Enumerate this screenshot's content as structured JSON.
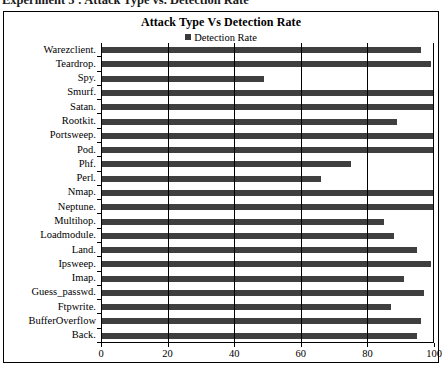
{
  "caption": "Experiment 5 : Attack Type vs. Detection Rate",
  "chart": {
    "title": "Attack Type Vs Detection Rate",
    "legend": {
      "label": "Detection Rate",
      "swatch_color": "#3a3a3a"
    }
  },
  "chart_data": {
    "type": "bar",
    "orientation": "horizontal",
    "title": "Attack Type Vs Detection Rate",
    "xlabel": "",
    "ylabel": "",
    "xlim": [
      0,
      100
    ],
    "xticks": [
      0,
      20,
      40,
      60,
      80,
      100
    ],
    "grid": true,
    "legend_position": "top-center",
    "series": [
      {
        "name": "Detection Rate",
        "color": "#3f3f3f",
        "values": [
          96,
          99,
          49,
          100,
          100,
          89,
          100,
          100,
          75,
          66,
          100,
          100,
          85,
          88,
          95,
          99,
          91,
          97,
          87,
          96,
          95
        ]
      }
    ],
    "categories": [
      "Warezclient.",
      "Teardrop.",
      "Spy.",
      "Smurf.",
      "Satan.",
      "Rootkit.",
      "Portsweep.",
      "Pod.",
      "Phf.",
      "Perl.",
      "Nmap.",
      "Neptune.",
      "Multihop.",
      "Loadmodule.",
      "Land.",
      "Ipsweep.",
      "Imap.",
      "Guess_passwd.",
      "Ftpwrite.",
      "BufferOverflow",
      "Back."
    ]
  }
}
